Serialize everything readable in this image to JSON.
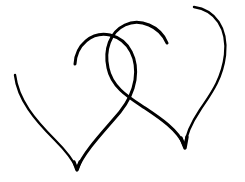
{
  "image": {
    "description": "Black line drawing of two interlocking hearts on a white background",
    "background_color": "#ffffff",
    "line_color": "#000000",
    "shapes": [
      {
        "name": "left-heart",
        "label": "Left heart outline"
      },
      {
        "name": "right-heart",
        "label": "Right heart outline"
      }
    ]
  }
}
